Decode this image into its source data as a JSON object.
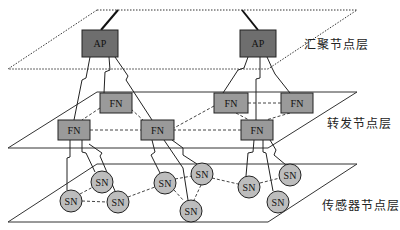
{
  "layers": [
    {
      "id": "aggregation",
      "label": "汇聚节点层",
      "label_pos": [
        304,
        42
      ],
      "style": "dotted"
    },
    {
      "id": "forwarding",
      "label": "转发节点层",
      "label_pos": [
        327,
        121
      ],
      "style": "solid"
    },
    {
      "id": "sensor",
      "label": "传感器节点层",
      "label_pos": [
        322,
        203
      ],
      "style": "solid"
    }
  ],
  "colors": {
    "ap_fill": "#6e6e6e",
    "fn_fill": "#9a9a9a",
    "sn_fill": "#bdbdbd",
    "stroke": "#222222",
    "plane_stroke": "#333333"
  },
  "nodes": {
    "ap": [
      {
        "id": "ap1",
        "label": "AP",
        "x": 82,
        "y": 30,
        "w": 36,
        "h": 27
      },
      {
        "id": "ap2",
        "label": "AP",
        "x": 240,
        "y": 30,
        "w": 36,
        "h": 27
      }
    ],
    "fn": [
      {
        "id": "fn1",
        "label": "FN",
        "x": 100,
        "y": 93,
        "w": 32,
        "h": 20
      },
      {
        "id": "fn2",
        "label": "FN",
        "x": 58,
        "y": 120,
        "w": 32,
        "h": 20
      },
      {
        "id": "fn3",
        "label": "FN",
        "x": 141,
        "y": 120,
        "w": 33,
        "h": 20
      },
      {
        "id": "fn4",
        "label": "FN",
        "x": 214,
        "y": 93,
        "w": 34,
        "h": 20
      },
      {
        "id": "fn5",
        "label": "FN",
        "x": 281,
        "y": 93,
        "w": 32,
        "h": 20
      },
      {
        "id": "fn6",
        "label": "FN",
        "x": 241,
        "y": 120,
        "w": 32,
        "h": 20
      }
    ],
    "sn": [
      {
        "id": "sn1",
        "label": "SN",
        "cx": 102,
        "cy": 182
      },
      {
        "id": "sn2",
        "label": "SN",
        "cx": 71,
        "cy": 201
      },
      {
        "id": "sn3",
        "label": "SN",
        "cx": 118,
        "cy": 202
      },
      {
        "id": "sn4",
        "label": "SN",
        "cx": 165,
        "cy": 183
      },
      {
        "id": "sn5",
        "label": "SN",
        "cx": 202,
        "cy": 174
      },
      {
        "id": "sn6",
        "label": "SN",
        "cx": 191,
        "cy": 211
      },
      {
        "id": "sn7",
        "label": "SN",
        "cx": 249,
        "cy": 187
      },
      {
        "id": "sn8",
        "label": "SN",
        "cx": 290,
        "cy": 175
      },
      {
        "id": "sn9",
        "label": "SN",
        "cx": 278,
        "cy": 202
      }
    ]
  }
}
